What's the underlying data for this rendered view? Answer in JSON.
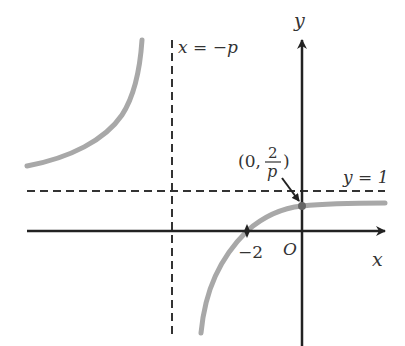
{
  "diagram": {
    "type": "function-graph",
    "labels": {
      "y_axis": "y",
      "x_axis": "x",
      "origin": "O",
      "vertical_asymptote": "x = −p",
      "horizontal_asymptote": "y = 1",
      "x_intercept": "−2",
      "y_intercept_prefix": "(0,",
      "y_intercept_numerator": "2",
      "y_intercept_denominator": "p",
      "y_intercept_suffix": ")"
    },
    "colors": {
      "axis": "#222222",
      "asymptote": "#333333",
      "curve": "#a8a8a8",
      "point": "#666666"
    },
    "points": [
      {
        "name": "x-intercept",
        "x": -2,
        "y": 0
      },
      {
        "name": "y-intercept",
        "x": 0,
        "y": "2/p"
      }
    ]
  }
}
